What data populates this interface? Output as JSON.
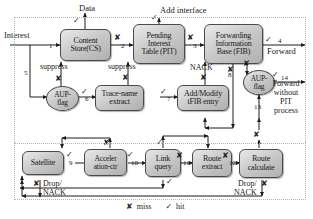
{
  "diagram": {
    "type": "flow-diagram"
  },
  "nodes": [
    {
      "id": "cs",
      "label": "Content\nStore(CS)",
      "shape": "rounded"
    },
    {
      "id": "pit",
      "label": "Pending\nInterest\nTable (PIT)",
      "shape": "rounded"
    },
    {
      "id": "fib",
      "label": "Forwarding\nInformation\nBase (FIB)",
      "shape": "rounded"
    },
    {
      "id": "aup1",
      "label": "AUP-\nflag",
      "shape": "oval"
    },
    {
      "id": "trace",
      "label": "Trace-name\nextract",
      "shape": "rounded"
    },
    {
      "id": "tfib",
      "label": "Add/Modify\ntFIB entry",
      "shape": "rounded"
    },
    {
      "id": "aup2",
      "label": "AUP-\nflag",
      "shape": "oval"
    },
    {
      "id": "sat",
      "label": "Satellite",
      "shape": "rounded"
    },
    {
      "id": "accel",
      "label": "Acceler\nation-ctr",
      "shape": "rounded"
    },
    {
      "id": "link",
      "label": "Link\nquery",
      "shape": "rounded"
    },
    {
      "id": "rextr",
      "label": "Route\nextract",
      "shape": "rounded"
    },
    {
      "id": "rcalc",
      "label": "Route\ncalculate",
      "shape": "rounded"
    }
  ],
  "labels": {
    "interest": "Interest",
    "data": "Data",
    "add_interface": "Add interface",
    "forward": "Forward",
    "forward_without_pit": "Forward\nwithout\nPIT\nprocess",
    "suppress_1": "suppress",
    "suppress_2": "suppress",
    "nack": "NACK",
    "drop_nack_left": "Drop/\nNACK",
    "drop_nack_right": "Drop/\nNACK"
  },
  "edge_numbers": [
    "1",
    "2",
    "3",
    "4",
    "5",
    "6",
    "7",
    "8",
    "9",
    "10",
    "11",
    "12",
    "13",
    "14"
  ],
  "marks": {
    "hit": "✓",
    "miss": "✘"
  },
  "legend": [
    {
      "mark": "✘",
      "text": "miss"
    },
    {
      "mark": "✓",
      "text": "hit"
    }
  ],
  "colors": {
    "node_fill": "#cccccc",
    "node_stroke": "#4a4a4a",
    "wire": "#222222",
    "text": "#1a1a1a",
    "frame": "#b9b9b9"
  }
}
